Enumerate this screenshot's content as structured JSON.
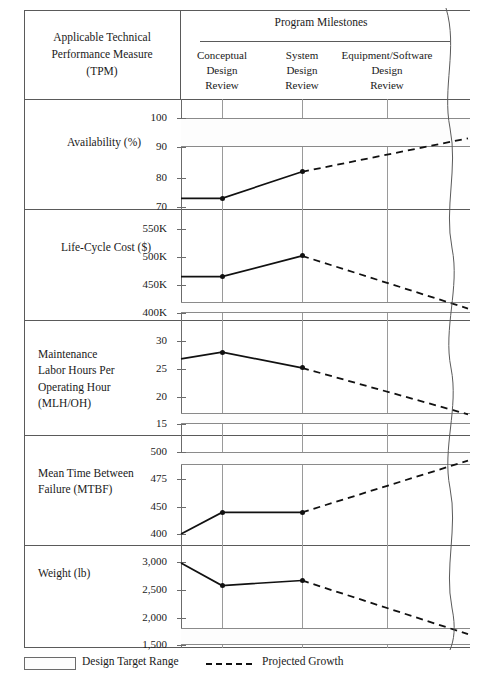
{
  "header": {
    "tpm_label": "Applicable Technical Performance Measure (TPM)",
    "tpm_line1": "Applicable Technical",
    "tpm_line2": "Performance Measure",
    "tpm_line3": "(TPM)",
    "milestones_title": "Program Milestones",
    "milestones": [
      {
        "name": "conceptual-design-review",
        "line1": "Conceptual",
        "line2": "Design",
        "line3": "Review"
      },
      {
        "name": "system-design-review",
        "line1": "System",
        "line2": "Design",
        "line3": "Review"
      },
      {
        "name": "equipment-software-design-review",
        "line1": "Equipment/Software",
        "line2": "Design",
        "line3": "Review"
      }
    ]
  },
  "legend": {
    "design_target_range": "Design Target Range",
    "projected_growth": "Projected Growth"
  },
  "chart_data": {
    "type": "line",
    "xlabel": "Program Milestones",
    "grid": true,
    "legend_position": "bottom-left",
    "x_categories": [
      "Conceptual Design Review",
      "System Design Review",
      "Equipment/Software Design Review"
    ],
    "panels": [
      {
        "ylabel": "Availability (%)",
        "label_lines": [
          "Availability (%)"
        ],
        "ticks": [
          100,
          90,
          80,
          70
        ],
        "tick_labels": [
          "100",
          "90",
          "80",
          "70"
        ],
        "ylim": [
          68,
          103
        ],
        "design_target_range": [
          90,
          100
        ],
        "measured": {
          "start": 73,
          "values": [
            73,
            82
          ]
        },
        "projected": {
          "from": 82,
          "to": 93
        },
        "units": "%"
      },
      {
        "ylabel": "Life-Cycle Cost ($)",
        "label_lines": [
          "Life-Cycle Cost ($)"
        ],
        "ticks": [
          550000,
          500000,
          450000,
          400000
        ],
        "tick_labels": [
          "550K",
          "500K",
          "450K",
          "400K"
        ],
        "ylim": [
          390000,
          560000
        ],
        "design_target_range": [
          400000,
          420000
        ],
        "measured": {
          "start": 465000,
          "values": [
            465000,
            502000
          ]
        },
        "projected": {
          "from": 502000,
          "to": 408000
        },
        "units": "$"
      },
      {
        "ylabel": "Maintenance Labor Hours Per Operating Hour (MLH/OH)",
        "label_lines": [
          "Maintenance",
          "Labor Hours Per",
          "Operating Hour",
          "(MLH/OH)"
        ],
        "ticks": [
          30,
          25,
          20,
          15
        ],
        "tick_labels": [
          "30",
          "25",
          "20",
          "15"
        ],
        "ylim": [
          13.5,
          31.5
        ],
        "design_target_range": [
          15,
          17
        ],
        "measured": {
          "start": 26.8,
          "values": [
            28,
            25.2
          ]
        },
        "projected": {
          "from": 25.2,
          "to": 16.8
        },
        "units": "MLH/OH"
      },
      {
        "ylabel": "Mean Time Between Failure (MTBF)",
        "label_lines": [
          "Mean Time Between",
          "Failure (MTBF)"
        ],
        "ticks": [
          500,
          475,
          450,
          400
        ],
        "tick_labels": [
          "500",
          "475",
          "450",
          "400"
        ],
        "ylim": [
          390,
          508
        ],
        "design_target_range": [
          488,
          500
        ],
        "measured": {
          "start": 400,
          "values": [
            440,
            440
          ]
        },
        "projected": {
          "from": 440,
          "to": 492
        },
        "units": "hours"
      },
      {
        "ylabel": "Weight (lb)",
        "label_lines": [
          "Weight (lb)"
        ],
        "ticks": [
          3000,
          2500,
          2000,
          1500
        ],
        "tick_labels": [
          "3,000",
          "2,500",
          "2,000",
          "1,500"
        ],
        "ylim": [
          1420,
          3080
        ],
        "design_target_range": [
          1500,
          1820
        ],
        "measured": {
          "start": 2980,
          "values": [
            2580,
            2670
          ]
        },
        "projected": {
          "from": 2670,
          "to": 1700
        },
        "units": "lb"
      }
    ]
  }
}
